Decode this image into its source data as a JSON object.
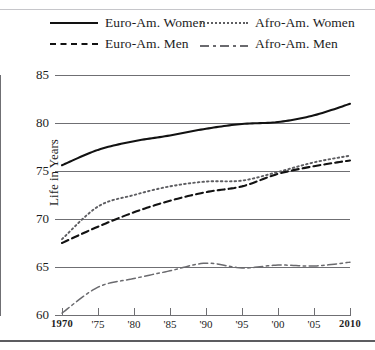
{
  "legend": {
    "entries": [
      {
        "label": "Euro-Am. Women",
        "style": "solid",
        "color": "#121212"
      },
      {
        "label": "Afro-Am. Women",
        "style": "dotted",
        "color": "#5d5d61"
      },
      {
        "label": "Euro-Am. Men",
        "style": "dashed",
        "color": "#121212"
      },
      {
        "label": "Afro-Am. Men",
        "style": "dashdot",
        "color": "#6a6a6e"
      }
    ]
  },
  "axes": {
    "ylabel": "Life in Years",
    "yticks": [
      "85",
      "80",
      "75",
      "70",
      "65",
      "60"
    ],
    "xticks": [
      "1970",
      "'75",
      "'80",
      "'85",
      "'90",
      "'95",
      "'00",
      "'05",
      "2010"
    ]
  },
  "chart_data": {
    "type": "line",
    "title": "",
    "xlabel": "",
    "ylabel": "Life in Years",
    "xlim": [
      1970,
      2010
    ],
    "ylim": [
      60,
      85
    ],
    "grid": true,
    "legend_position": "top",
    "x": [
      1970,
      1975,
      1980,
      1985,
      1990,
      1995,
      2000,
      2005,
      2010
    ],
    "series": [
      {
        "name": "Euro-Am. Women",
        "style": "solid",
        "color": "#121212",
        "values": [
          75.6,
          77.2,
          78.1,
          78.7,
          79.4,
          79.9,
          80.1,
          80.8,
          82.0
        ]
      },
      {
        "name": "Afro-Am. Women",
        "style": "dotted",
        "color": "#5d5d61",
        "values": [
          67.9,
          71.3,
          72.5,
          73.4,
          73.9,
          74.0,
          74.9,
          75.9,
          76.6
        ]
      },
      {
        "name": "Euro-Am. Men",
        "style": "dashed",
        "color": "#121212",
        "values": [
          67.5,
          69.2,
          70.7,
          71.9,
          72.8,
          73.4,
          74.7,
          75.5,
          76.1
        ]
      },
      {
        "name": "Afro-Am. Men",
        "style": "dashdot",
        "color": "#6a6a6e",
        "values": [
          60.2,
          62.9,
          63.8,
          64.6,
          65.4,
          64.9,
          65.2,
          65.1,
          65.5
        ]
      }
    ]
  }
}
